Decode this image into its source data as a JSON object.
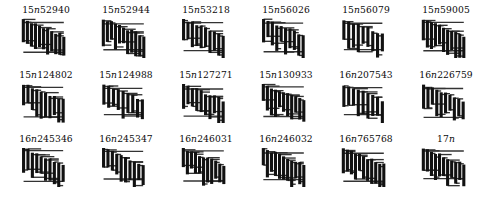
{
  "figure": {
    "type": "knot-diagram-table",
    "columns": 6,
    "rows": 3,
    "background_color": "#ffffff",
    "vertical_strand_color": "#111111",
    "horizontal_strand_color": "#333333",
    "label_color": "#0a0a0a"
  },
  "knots": [
    {
      "label": "15n52940",
      "prefix": "15",
      "var": "n",
      "index": "52940",
      "crossing_number": 15
    },
    {
      "label": "15n52944",
      "prefix": "15",
      "var": "n",
      "index": "52944",
      "crossing_number": 15
    },
    {
      "label": "15n53218",
      "prefix": "15",
      "var": "n",
      "index": "53218",
      "crossing_number": 15
    },
    {
      "label": "15n56026",
      "prefix": "15",
      "var": "n",
      "index": "56026",
      "crossing_number": 15
    },
    {
      "label": "15n56079",
      "prefix": "15",
      "var": "n",
      "index": "56079",
      "crossing_number": 15
    },
    {
      "label": "15n59005",
      "prefix": "15",
      "var": "n",
      "index": "59005",
      "crossing_number": 15
    },
    {
      "label": "15n124802",
      "prefix": "15",
      "var": "n",
      "index": "124802",
      "crossing_number": 15
    },
    {
      "label": "15n124988",
      "prefix": "15",
      "var": "n",
      "index": "124988",
      "crossing_number": 15
    },
    {
      "label": "15n127271",
      "prefix": "15",
      "var": "n",
      "index": "127271",
      "crossing_number": 15
    },
    {
      "label": "15n130933",
      "prefix": "15",
      "var": "n",
      "index": "130933",
      "crossing_number": 15
    },
    {
      "label": "16n207543",
      "prefix": "16",
      "var": "n",
      "index": "207543",
      "crossing_number": 16
    },
    {
      "label": "16n226759",
      "prefix": "16",
      "var": "n",
      "index": "226759",
      "crossing_number": 16
    },
    {
      "label": "16n245346",
      "prefix": "16",
      "var": "n",
      "index": "245346",
      "crossing_number": 16
    },
    {
      "label": "16n245347",
      "prefix": "16",
      "var": "n",
      "index": "245347",
      "crossing_number": 16
    },
    {
      "label": "16n246031",
      "prefix": "16",
      "var": "n",
      "index": "246031",
      "crossing_number": 16
    },
    {
      "label": "16n246032",
      "prefix": "16",
      "var": "n",
      "index": "246032",
      "crossing_number": 16
    },
    {
      "label": "16n765768",
      "prefix": "16",
      "var": "n",
      "index": "765768",
      "crossing_number": 16
    },
    {
      "label": "17n",
      "prefix": "17",
      "var": "n",
      "index": "",
      "crossing_number": 17
    }
  ],
  "diagrams": [
    {
      "name": "grid-diagram-15n52940",
      "grid_size": 12,
      "verticals": [
        [
          0,
          0,
          9
        ],
        [
          1,
          1,
          11
        ],
        [
          2,
          0,
          7
        ],
        [
          3,
          2,
          10
        ],
        [
          4,
          1,
          8
        ],
        [
          5,
          3,
          11
        ],
        [
          6,
          2,
          9
        ],
        [
          7,
          4,
          10
        ],
        [
          8,
          3,
          8
        ],
        [
          9,
          5,
          11
        ],
        [
          10,
          4,
          9
        ],
        [
          11,
          6,
          10
        ]
      ],
      "horizontals": [
        [
          0,
          0,
          2
        ],
        [
          1,
          1,
          4
        ],
        [
          2,
          0,
          3
        ],
        [
          3,
          1,
          5
        ],
        [
          4,
          2,
          6
        ],
        [
          5,
          3,
          7
        ],
        [
          6,
          4,
          8
        ],
        [
          7,
          5,
          9
        ],
        [
          8,
          6,
          10
        ],
        [
          9,
          7,
          11
        ],
        [
          10,
          8,
          11
        ],
        [
          11,
          9,
          11
        ]
      ]
    }
  ]
}
